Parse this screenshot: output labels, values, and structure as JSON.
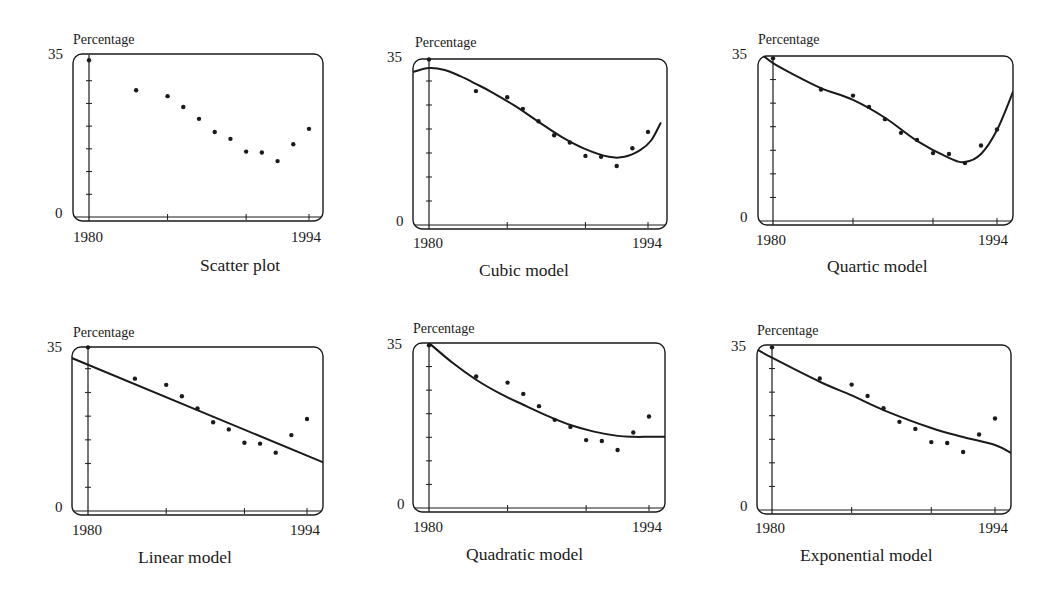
{
  "figure": {
    "panels_order": [
      "scatter",
      "cubic",
      "quartic",
      "linear",
      "quadratic",
      "exponential"
    ]
  },
  "chart_data": [
    {
      "id": "scatter",
      "type": "scatter",
      "title": "Scatter plot",
      "ylabel": "Percentage",
      "xlabel": "",
      "x_tick_labels": [
        "1980",
        "1994"
      ],
      "y_tick_labels": [
        "35",
        "0"
      ],
      "xlim": [
        1980,
        1994
      ],
      "ylim": [
        0,
        35
      ],
      "points": [
        [
          1980,
          34.5
        ],
        [
          1983,
          27.9
        ],
        [
          1985,
          26.6
        ],
        [
          1986,
          24.2
        ],
        [
          1987,
          21.6
        ],
        [
          1988,
          18.7
        ],
        [
          1989,
          17.2
        ],
        [
          1990,
          14.4
        ],
        [
          1991,
          14.2
        ],
        [
          1992,
          12.3
        ],
        [
          1993,
          16.0
        ],
        [
          1994,
          19.4
        ]
      ],
      "curve": []
    },
    {
      "id": "cubic",
      "type": "scatter",
      "title": "Cubic model",
      "ylabel": "Percentage",
      "xlabel": "",
      "x_tick_labels": [
        "1980",
        "1994"
      ],
      "y_tick_labels": [
        "35",
        "0"
      ],
      "xlim": [
        1980,
        1994
      ],
      "ylim": [
        0,
        35
      ],
      "points": [
        [
          1980,
          34.5
        ],
        [
          1983,
          27.9
        ],
        [
          1985,
          26.6
        ],
        [
          1986,
          24.2
        ],
        [
          1987,
          21.6
        ],
        [
          1988,
          18.7
        ],
        [
          1989,
          17.2
        ],
        [
          1990,
          14.4
        ],
        [
          1991,
          14.2
        ],
        [
          1992,
          12.3
        ],
        [
          1993,
          16.0
        ],
        [
          1994,
          19.4
        ]
      ],
      "curve": [
        [
          1979.0,
          31.9
        ],
        [
          1980.0,
          32.7
        ],
        [
          1981.0,
          32.3
        ],
        [
          1982.0,
          31.0
        ],
        [
          1983.0,
          29.4
        ],
        [
          1984.0,
          27.7
        ],
        [
          1985.5,
          24.8
        ],
        [
          1987.0,
          21.5
        ],
        [
          1988.5,
          18.3
        ],
        [
          1990.0,
          15.8
        ],
        [
          1991.5,
          14.2
        ],
        [
          1992.5,
          14.2
        ],
        [
          1993.5,
          15.6
        ],
        [
          1994.2,
          17.6
        ],
        [
          1994.8,
          21.2
        ]
      ]
    },
    {
      "id": "quartic",
      "type": "scatter",
      "title": "Quartic model",
      "ylabel": "Percentage",
      "xlabel": "",
      "x_tick_labels": [
        "1980",
        "1994"
      ],
      "y_tick_labels": [
        "35",
        "0"
      ],
      "xlim": [
        1980,
        1994
      ],
      "ylim": [
        0,
        35
      ],
      "points": [
        [
          1980,
          34.5
        ],
        [
          1983,
          27.9
        ],
        [
          1985,
          26.6
        ],
        [
          1986,
          24.2
        ],
        [
          1987,
          21.6
        ],
        [
          1988,
          18.7
        ],
        [
          1989,
          17.2
        ],
        [
          1990,
          14.4
        ],
        [
          1991,
          14.2
        ],
        [
          1992,
          12.3
        ],
        [
          1993,
          16.0
        ],
        [
          1994,
          19.4
        ]
      ],
      "curve": [
        [
          1979.4,
          35.0
        ],
        [
          1980.0,
          33.5
        ],
        [
          1981.0,
          31.6
        ],
        [
          1983.0,
          28.2
        ],
        [
          1985.0,
          25.7
        ],
        [
          1987.0,
          21.9
        ],
        [
          1989.0,
          17.0
        ],
        [
          1991.0,
          13.4
        ],
        [
          1992.0,
          12.5
        ],
        [
          1993.0,
          14.2
        ],
        [
          1994.0,
          19.3
        ],
        [
          1995.0,
          27.4
        ]
      ]
    },
    {
      "id": "linear",
      "type": "scatter",
      "title": "Linear model",
      "ylabel": "Percentage",
      "xlabel": "",
      "x_tick_labels": [
        "1980",
        "1994"
      ],
      "y_tick_labels": [
        "35",
        "0"
      ],
      "xlim": [
        1980,
        1994
      ],
      "ylim": [
        0,
        35
      ],
      "points": [
        [
          1980,
          34.5
        ],
        [
          1983,
          27.9
        ],
        [
          1985,
          26.6
        ],
        [
          1986,
          24.2
        ],
        [
          1987,
          21.6
        ],
        [
          1988,
          18.7
        ],
        [
          1989,
          17.2
        ],
        [
          1990,
          14.4
        ],
        [
          1991,
          14.2
        ],
        [
          1992,
          12.3
        ],
        [
          1993,
          16.0
        ],
        [
          1994,
          19.4
        ]
      ],
      "curve": [
        [
          1979.0,
          32.2
        ],
        [
          1995.0,
          10.3
        ]
      ]
    },
    {
      "id": "quadratic",
      "type": "scatter",
      "title": "Quadratic model",
      "ylabel": "Percentage",
      "xlabel": "",
      "x_tick_labels": [
        "1980",
        "1994"
      ],
      "y_tick_labels": [
        "35",
        "0"
      ],
      "xlim": [
        1980,
        1994
      ],
      "ylim": [
        0,
        35
      ],
      "points": [
        [
          1980,
          34.5
        ],
        [
          1983,
          27.9
        ],
        [
          1985,
          26.6
        ],
        [
          1986,
          24.2
        ],
        [
          1987,
          21.6
        ],
        [
          1988,
          18.7
        ],
        [
          1989,
          17.2
        ],
        [
          1990,
          14.4
        ],
        [
          1991,
          14.2
        ],
        [
          1992,
          12.3
        ],
        [
          1993,
          16.0
        ],
        [
          1994,
          19.4
        ]
      ],
      "curve": [
        [
          1980.0,
          35.0
        ],
        [
          1981.5,
          30.8
        ],
        [
          1983.0,
          27.2
        ],
        [
          1984.5,
          24.3
        ],
        [
          1986.0,
          21.9
        ],
        [
          1987.5,
          19.6
        ],
        [
          1989.0,
          17.6
        ],
        [
          1990.5,
          16.2
        ],
        [
          1992.0,
          15.3
        ],
        [
          1993.0,
          15.1
        ],
        [
          1994.0,
          15.1
        ],
        [
          1995.0,
          15.1
        ]
      ]
    },
    {
      "id": "exponential",
      "type": "scatter",
      "title": "Exponential model",
      "ylabel": "Percentage",
      "xlabel": "",
      "x_tick_labels": [
        "1980",
        "1994"
      ],
      "y_tick_labels": [
        "35",
        "0"
      ],
      "xlim": [
        1980,
        1994
      ],
      "ylim": [
        0,
        35
      ],
      "points": [
        [
          1980,
          34.5
        ],
        [
          1983,
          27.9
        ],
        [
          1985,
          26.6
        ],
        [
          1986,
          24.2
        ],
        [
          1987,
          21.6
        ],
        [
          1988,
          18.7
        ],
        [
          1989,
          17.2
        ],
        [
          1990,
          14.4
        ],
        [
          1991,
          14.2
        ],
        [
          1992,
          12.3
        ],
        [
          1993,
          16.0
        ],
        [
          1994,
          19.4
        ]
      ],
      "curve": [
        [
          1979.0,
          34.2
        ],
        [
          1980.0,
          32.3
        ],
        [
          1983.0,
          27.2
        ],
        [
          1985.0,
          24.3
        ],
        [
          1987.0,
          21.2
        ],
        [
          1990.0,
          17.4
        ],
        [
          1992.0,
          15.5
        ],
        [
          1994.0,
          13.8
        ],
        [
          1995.0,
          12.1
        ]
      ]
    }
  ],
  "style": {
    "ink": "#1a1a1a",
    "background": "#ffffff"
  }
}
